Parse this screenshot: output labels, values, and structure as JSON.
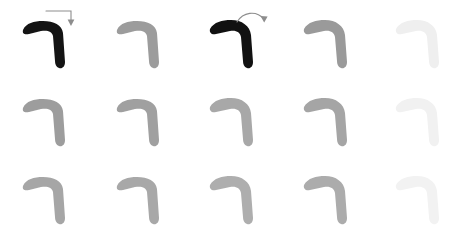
{
  "sheet": {
    "title": "Stroke Practice Grid",
    "description": "Handwriting practice sheet for the CJK horizontal-turn stroke",
    "background_color": "#ffffff",
    "columns": 5,
    "rows": 3,
    "stroke_name": "horizontal-turn",
    "stroke_glyph": "┐"
  },
  "palette": {
    "ink_black": "#111111",
    "ink_dark_gray": "#8f8f8f",
    "ink_mid_gray": "#9c9c9c",
    "ink_light_gray": "#b3b3b3",
    "ink_faint_gray": "#efefef",
    "arrow_gray": "#9a9a9a",
    "background": "#ffffff"
  },
  "grid": {
    "cells": [
      {
        "id": "r1c1",
        "row": 1,
        "col": 1,
        "x": 18,
        "y": 12,
        "shade": "#141414",
        "opacity": 1,
        "variant": "sharp",
        "annotated": true,
        "arrow": "right-angle-down"
      },
      {
        "id": "r1c2",
        "row": 1,
        "col": 2,
        "x": 112,
        "y": 12,
        "shade": "#9c9c9c",
        "opacity": 1,
        "variant": "sharp",
        "annotated": false,
        "arrow": "none"
      },
      {
        "id": "r1c3",
        "row": 1,
        "col": 3,
        "x": 204,
        "y": 12,
        "shade": "#111111",
        "opacity": 1,
        "variant": "round",
        "annotated": true,
        "arrow": "curved-down"
      },
      {
        "id": "r1c4",
        "row": 1,
        "col": 4,
        "x": 298,
        "y": 12,
        "shade": "#9a9a9a",
        "opacity": 1,
        "variant": "round",
        "annotated": false,
        "arrow": "none"
      },
      {
        "id": "r1c5",
        "row": 1,
        "col": 5,
        "x": 390,
        "y": 12,
        "shade": "#efefef",
        "opacity": 1,
        "variant": "round",
        "annotated": false,
        "arrow": "none"
      },
      {
        "id": "r2c1",
        "row": 2,
        "col": 1,
        "x": 18,
        "y": 90,
        "shade": "#9d9d9d",
        "opacity": 1,
        "variant": "sharp",
        "annotated": false,
        "arrow": "none"
      },
      {
        "id": "r2c2",
        "row": 2,
        "col": 2,
        "x": 112,
        "y": 90,
        "shade": "#a0a0a0",
        "opacity": 1,
        "variant": "sharp",
        "annotated": false,
        "arrow": "none"
      },
      {
        "id": "r2c3",
        "row": 2,
        "col": 3,
        "x": 204,
        "y": 90,
        "shade": "#a8a8a8",
        "opacity": 1,
        "variant": "round",
        "annotated": false,
        "arrow": "none"
      },
      {
        "id": "r2c4",
        "row": 2,
        "col": 4,
        "x": 298,
        "y": 90,
        "shade": "#a5a5a5",
        "opacity": 1,
        "variant": "round",
        "annotated": false,
        "arrow": "none"
      },
      {
        "id": "r2c5",
        "row": 2,
        "col": 5,
        "x": 390,
        "y": 90,
        "shade": "#f1f1f1",
        "opacity": 1,
        "variant": "round",
        "annotated": false,
        "arrow": "none"
      },
      {
        "id": "r3c1",
        "row": 3,
        "col": 1,
        "x": 18,
        "y": 168,
        "shade": "#a6a6a6",
        "opacity": 1,
        "variant": "sharp",
        "annotated": false,
        "arrow": "none"
      },
      {
        "id": "r3c2",
        "row": 3,
        "col": 2,
        "x": 112,
        "y": 168,
        "shade": "#a8a8a8",
        "opacity": 1,
        "variant": "sharp",
        "annotated": false,
        "arrow": "none"
      },
      {
        "id": "r3c3",
        "row": 3,
        "col": 3,
        "x": 204,
        "y": 168,
        "shade": "#aeaeae",
        "opacity": 1,
        "variant": "round",
        "annotated": false,
        "arrow": "none"
      },
      {
        "id": "r3c4",
        "row": 3,
        "col": 4,
        "x": 298,
        "y": 168,
        "shade": "#acacac",
        "opacity": 1,
        "variant": "round",
        "annotated": false,
        "arrow": "none"
      },
      {
        "id": "r3c5",
        "row": 3,
        "col": 5,
        "x": 390,
        "y": 168,
        "shade": "#f2f2f2",
        "opacity": 1,
        "variant": "round",
        "annotated": false,
        "arrow": "none"
      }
    ]
  },
  "annotations": [
    {
      "id": "arrow-1",
      "type": "right-angle-down",
      "target_cell": "r1c1",
      "x": 44,
      "y": 8,
      "color": "#8d8d8d",
      "label": "stroke-direction-arrow"
    },
    {
      "id": "arrow-2",
      "type": "curved-down",
      "target_cell": "r1c3",
      "x": 234,
      "y": 8,
      "color": "#8d8d8d",
      "label": "stroke-direction-arrow"
    }
  ]
}
